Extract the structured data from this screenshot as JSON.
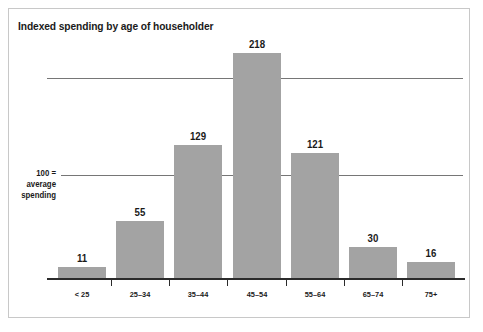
{
  "chart_data": {
    "type": "bar",
    "title": "Indexed spending by age of householder",
    "xlabel": "",
    "ylabel": "",
    "categories": [
      "< 25",
      "25–34",
      "35–44",
      "45–54",
      "55–64",
      "65–74",
      "75+"
    ],
    "values": [
      11,
      55,
      129,
      218,
      121,
      30,
      16
    ],
    "value_labels": [
      "11",
      "55",
      "129",
      "218",
      "121",
      "30",
      "16"
    ],
    "ylim": [
      0,
      260
    ],
    "grid": true,
    "gridlines": [
      100,
      200
    ],
    "legend": "none",
    "annotations": [
      {
        "name": "baseline-reference",
        "lines": [
          "100 =",
          "average",
          "spending"
        ],
        "value": 100
      }
    ],
    "series_color": "#a3a3a3",
    "gridline_color": "#767676",
    "axis_color": "#2b2b2b",
    "background": "#ffffff"
  },
  "figure": {
    "title": "Indexed spending by age of householder",
    "frame_color": "#c8c8c8"
  },
  "annotation": {
    "line1": "100 =",
    "line2": "average",
    "line3": "spending"
  }
}
